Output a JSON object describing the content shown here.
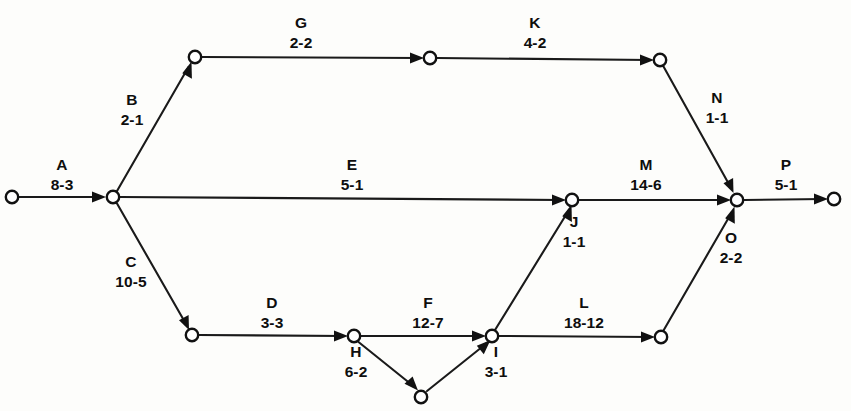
{
  "diagram": {
    "type": "activity-on-arrow-network",
    "background_color": "#fdfdfb",
    "line_color": "#1a1a1a",
    "node_fill": "#ffffff",
    "nodes": [
      {
        "id": "n1",
        "x": 12,
        "y": 197
      },
      {
        "id": "n2",
        "x": 113,
        "y": 197
      },
      {
        "id": "n3",
        "x": 195,
        "y": 57
      },
      {
        "id": "n4",
        "x": 430,
        "y": 58
      },
      {
        "id": "n5",
        "x": 660,
        "y": 60
      },
      {
        "id": "n6",
        "x": 192,
        "y": 335
      },
      {
        "id": "n7",
        "x": 354,
        "y": 336
      },
      {
        "id": "n8",
        "x": 421,
        "y": 397
      },
      {
        "id": "n9",
        "x": 492,
        "y": 336
      },
      {
        "id": "n10",
        "x": 572,
        "y": 200
      },
      {
        "id": "n11",
        "x": 661,
        "y": 337
      },
      {
        "id": "n12",
        "x": 737,
        "y": 200
      },
      {
        "id": "n13",
        "x": 834,
        "y": 199
      }
    ],
    "edges": [
      {
        "id": "A",
        "from": "n1",
        "to": "n2",
        "label": "A",
        "duration": "8-3",
        "label_x": 62,
        "label_y": 157
      },
      {
        "id": "B",
        "from": "n2",
        "to": "n3",
        "label": "B",
        "duration": "2-1",
        "label_x": 132,
        "label_y": 92
      },
      {
        "id": "G",
        "from": "n3",
        "to": "n4",
        "label": "G",
        "duration": "2-2",
        "label_x": 301,
        "label_y": 15
      },
      {
        "id": "K",
        "from": "n4",
        "to": "n5",
        "label": "K",
        "duration": "4-2",
        "label_x": 535,
        "label_y": 15
      },
      {
        "id": "N",
        "from": "n5",
        "to": "n12",
        "label": "N",
        "duration": "1-1",
        "label_x": 717,
        "label_y": 90
      },
      {
        "id": "E",
        "from": "n2",
        "to": "n10",
        "label": "E",
        "duration": "5-1",
        "label_x": 352,
        "label_y": 157
      },
      {
        "id": "M",
        "from": "n10",
        "to": "n12",
        "label": "M",
        "duration": "14-6",
        "label_x": 646,
        "label_y": 157
      },
      {
        "id": "P",
        "from": "n12",
        "to": "n13",
        "label": "P",
        "duration": "5-1",
        "label_x": 786,
        "label_y": 157
      },
      {
        "id": "C",
        "from": "n2",
        "to": "n6",
        "label": "C",
        "duration": "10-5",
        "label_x": 131,
        "label_y": 254
      },
      {
        "id": "J",
        "from": "n9",
        "to": "n10",
        "label": "J",
        "duration": "1-1",
        "label_x": 574,
        "label_y": 214
      },
      {
        "id": "O",
        "from": "n11",
        "to": "n12",
        "label": "O",
        "duration": "2-2",
        "label_x": 731,
        "label_y": 230
      },
      {
        "id": "D",
        "from": "n6",
        "to": "n7",
        "label": "D",
        "duration": "3-3",
        "label_x": 272,
        "label_y": 295
      },
      {
        "id": "F",
        "from": "n7",
        "to": "n9",
        "label": "F",
        "duration": "12-7",
        "label_x": 428,
        "label_y": 295
      },
      {
        "id": "L",
        "from": "n9",
        "to": "n11",
        "label": "L",
        "duration": "18-12",
        "label_x": 584,
        "label_y": 295
      },
      {
        "id": "H",
        "from": "n7",
        "to": "n8",
        "label": "H",
        "duration": "6-2",
        "label_x": 356,
        "label_y": 344
      },
      {
        "id": "I",
        "from": "n8",
        "to": "n9",
        "label": "I",
        "duration": "3-1",
        "label_x": 496,
        "label_y": 344
      }
    ]
  }
}
